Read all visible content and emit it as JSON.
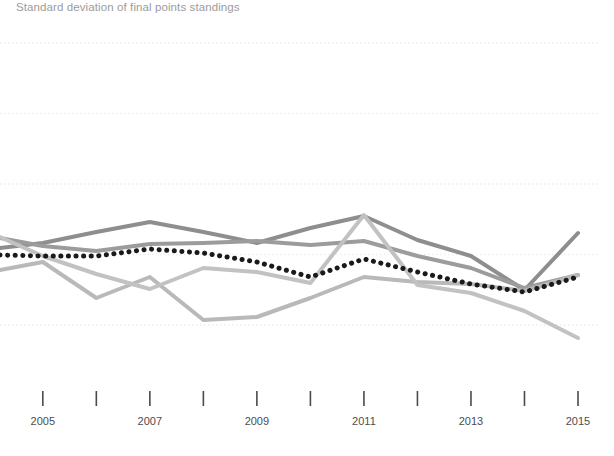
{
  "chart": {
    "title": "Standard deviation of final points standings",
    "axis": {
      "x_ticks": [
        2005,
        2006,
        2007,
        2008,
        2009,
        2010,
        2011,
        2012,
        2013,
        2014,
        2015
      ],
      "x_tick_labels": [
        "2005",
        "",
        "2007",
        "",
        "2009",
        "",
        "2011",
        "",
        "2013",
        "",
        "2015"
      ],
      "x_labels_shown": [
        "2005",
        "2007",
        "2009",
        "2011",
        "2013",
        "2015"
      ],
      "gridline_count": 5
    },
    "colors": {
      "title": "#9b9b9b",
      "tick_text": "#4d4d4d",
      "gridline": "#e9eef2",
      "axis_tick": "#4a4a4a",
      "series_dark": "#8e8e8e",
      "series_mid": "#9c9c9c",
      "series_light": "#b9b9b9",
      "series_light2": "#c2c2c2",
      "series_dotted": "#1a1a1a"
    }
  },
  "chart_data": {
    "type": "line",
    "title": "Standard deviation of final points standings",
    "xlabel": "",
    "ylabel": "",
    "grid": true,
    "legend": "none",
    "x": [
      2004.2,
      2005,
      2006,
      2007,
      2008,
      2009,
      2010,
      2011,
      2012,
      2013,
      2014,
      2015
    ],
    "xlim": [
      2004.2,
      2015
    ],
    "ylim_pixels": [
      43,
      325
    ],
    "series": [
      {
        "name": "series-1",
        "style": "solid",
        "color": "#8e8e8e",
        "width": 4,
        "values_px": [
          248,
          243,
          232,
          222,
          232,
          243,
          228,
          216,
          240,
          256,
          290,
          233
        ]
      },
      {
        "name": "series-2",
        "style": "solid",
        "color": "#9c9c9c",
        "width": 4,
        "values_px": [
          238,
          246,
          251,
          244,
          243,
          241,
          245,
          241,
          256,
          268,
          288,
          275
        ]
      },
      {
        "name": "series-3",
        "style": "solid",
        "color": "#b9b9b9",
        "width": 4,
        "values_px": [
          270,
          262,
          298,
          277,
          320,
          317,
          298,
          277,
          282,
          284,
          291,
          275
        ]
      },
      {
        "name": "series-4",
        "style": "solid",
        "color": "#c2c2c2",
        "width": 4,
        "values_px": [
          237,
          256,
          274,
          289,
          268,
          272,
          283,
          215,
          285,
          293,
          311,
          338
        ]
      },
      {
        "name": "series-average",
        "style": "dotted",
        "color": "#1a1a1a",
        "width": 5,
        "values_px": [
          255,
          256,
          256,
          249,
          253,
          262,
          277,
          259,
          272,
          284,
          292,
          277
        ]
      }
    ]
  }
}
